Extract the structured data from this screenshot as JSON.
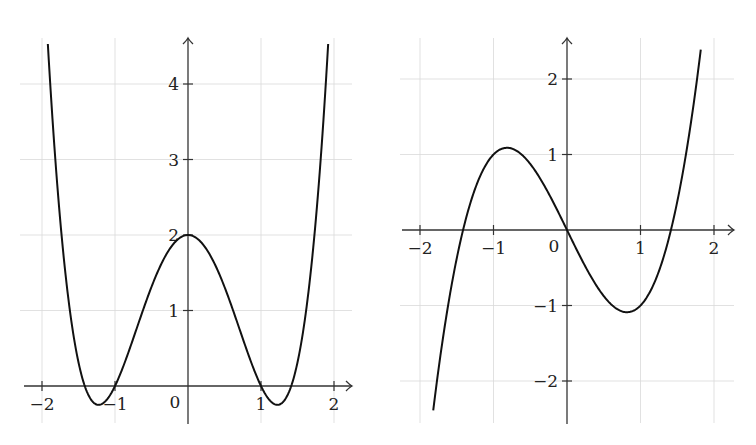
{
  "chart_data": [
    {
      "type": "line",
      "title": "",
      "xlabel": "",
      "ylabel": "",
      "function": "x^4 - 3x^2 + 2",
      "xlim": [
        -2.2,
        2.2
      ],
      "ylim": [
        -0.5,
        4.6
      ],
      "x_ticks": [
        -2,
        -1,
        0,
        1,
        2
      ],
      "x_tick_labels": [
        "−2",
        "−1",
        "0",
        "1",
        "2"
      ],
      "y_ticks": [
        1,
        2,
        3,
        4
      ],
      "y_tick_labels": [
        "1",
        "2",
        "3",
        "4"
      ],
      "grid": true,
      "domain": [
        -1.92,
        1.92
      ],
      "key_points": [
        {
          "x": -1.92,
          "y": 4.4
        },
        {
          "x": -1.414,
          "y": 0
        },
        {
          "x": -1.225,
          "y": -0.25
        },
        {
          "x": -1,
          "y": 0
        },
        {
          "x": 0,
          "y": 2
        },
        {
          "x": 1,
          "y": 0
        },
        {
          "x": 1.225,
          "y": -0.25
        },
        {
          "x": 1.414,
          "y": 0
        },
        {
          "x": 1.92,
          "y": 4.4
        }
      ]
    },
    {
      "type": "line",
      "title": "",
      "xlabel": "",
      "ylabel": "",
      "function": "x^3 - 2x",
      "xlim": [
        -2.2,
        2.2
      ],
      "ylim": [
        -2.6,
        2.5
      ],
      "x_ticks": [
        -2,
        -1,
        0,
        1,
        2
      ],
      "x_tick_labels": [
        "−2",
        "−1",
        "0",
        "1",
        "2"
      ],
      "y_ticks": [
        -2,
        -1,
        1,
        2
      ],
      "y_tick_labels": [
        "−2",
        "−1",
        "1",
        "2"
      ],
      "grid": true,
      "domain": [
        -1.82,
        1.82
      ],
      "key_points": [
        {
          "x": -1.82,
          "y": -2.39
        },
        {
          "x": -1.414,
          "y": 0
        },
        {
          "x": -0.816,
          "y": 1.09
        },
        {
          "x": 0,
          "y": 0
        },
        {
          "x": 0.816,
          "y": -1.09
        },
        {
          "x": 1.414,
          "y": 0
        },
        {
          "x": 1.82,
          "y": 2.39
        }
      ]
    }
  ]
}
